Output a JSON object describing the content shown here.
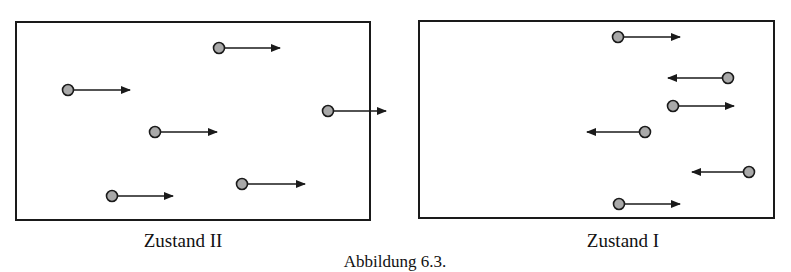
{
  "figure": {
    "caption": "Abbildung 6.3.",
    "caption_x": 395,
    "colors": {
      "stroke": "#1a1a1a",
      "particle_fill": "#a9a9a9",
      "background": "#ffffff"
    },
    "panels": [
      {
        "id": "left",
        "label": "Zustand II",
        "label_x": 183,
        "box": {
          "x": 16,
          "y": 22,
          "w": 354,
          "h": 198
        },
        "particles": [
          {
            "cx": 219,
            "cy": 48,
            "dir": "right",
            "tip_x": 280
          },
          {
            "cx": 68,
            "cy": 90,
            "dir": "right",
            "tip_x": 130
          },
          {
            "cx": 328,
            "cy": 111,
            "dir": "right",
            "tip_x": 386
          },
          {
            "cx": 155,
            "cy": 132,
            "dir": "right",
            "tip_x": 217
          },
          {
            "cx": 242,
            "cy": 184,
            "dir": "right",
            "tip_x": 305
          },
          {
            "cx": 112,
            "cy": 196,
            "dir": "right",
            "tip_x": 173
          }
        ]
      },
      {
        "id": "right",
        "label": "Zustand I",
        "label_x": 623,
        "box": {
          "x": 419,
          "y": 21,
          "w": 355,
          "h": 197
        },
        "particles": [
          {
            "cx": 618,
            "cy": 37,
            "dir": "right",
            "tip_x": 680
          },
          {
            "cx": 728,
            "cy": 78,
            "dir": "left",
            "tip_x": 668
          },
          {
            "cx": 673,
            "cy": 106,
            "dir": "right",
            "tip_x": 734
          },
          {
            "cx": 645,
            "cy": 132,
            "dir": "left",
            "tip_x": 587
          },
          {
            "cx": 749,
            "cy": 172,
            "dir": "left",
            "tip_x": 692
          },
          {
            "cx": 619,
            "cy": 204,
            "dir": "right",
            "tip_x": 680
          }
        ]
      }
    ]
  }
}
